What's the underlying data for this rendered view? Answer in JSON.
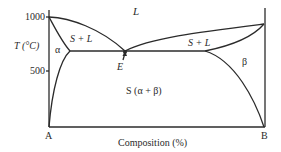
{
  "diagram": {
    "type": "binary eutectic phase diagram",
    "y_axis": {
      "label": "T (°C)",
      "ticks": [
        "1000",
        "500"
      ]
    },
    "x_axis": {
      "label": "Composition (%)",
      "left_end": "A",
      "right_end": "B"
    },
    "regions": {
      "liquid": "L",
      "left_two_phase": "S + L",
      "right_two_phase": "S + L",
      "alpha": "α",
      "beta": "β",
      "solid": "S (α + β)"
    },
    "eutectic_point": "E"
  }
}
